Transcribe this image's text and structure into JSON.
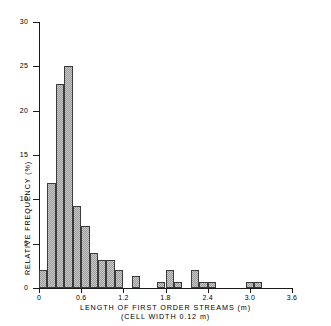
{
  "chart_data": {
    "type": "bar",
    "title": "",
    "xlabel": "LENGTH OF FIRST ORDER STREAMS (m)",
    "xsublabel": "(CELL WIDTH 0.12 m)",
    "ylabel": "RELATIVE FREQUENCY (%)",
    "xlim": [
      0,
      3.6
    ],
    "ylim": [
      0,
      30
    ],
    "grid": false,
    "legend": null,
    "bin_width": 0.12,
    "xticks": [
      0,
      0.6,
      1.2,
      1.8,
      2.4,
      3.0,
      3.6
    ],
    "xtick_labels": [
      "0",
      "0.6",
      "1.2",
      "1.8",
      "2.4",
      "3.0",
      "3.6"
    ],
    "yticks": [
      0,
      5,
      10,
      15,
      20,
      25,
      30
    ],
    "ytick_labels": [
      "0",
      "5",
      "10",
      "15",
      "20",
      "25",
      "30"
    ],
    "bars": [
      {
        "bin_start": 0.0,
        "bin_end": 0.12,
        "value": 2.0
      },
      {
        "bin_start": 0.12,
        "bin_end": 0.24,
        "value": 11.8
      },
      {
        "bin_start": 0.24,
        "bin_end": 0.36,
        "value": 23.0
      },
      {
        "bin_start": 0.36,
        "bin_end": 0.48,
        "value": 25.0
      },
      {
        "bin_start": 0.48,
        "bin_end": 0.6,
        "value": 9.2
      },
      {
        "bin_start": 0.6,
        "bin_end": 0.72,
        "value": 7.0
      },
      {
        "bin_start": 0.72,
        "bin_end": 0.84,
        "value": 4.0
      },
      {
        "bin_start": 0.84,
        "bin_end": 0.96,
        "value": 3.2
      },
      {
        "bin_start": 0.96,
        "bin_end": 1.08,
        "value": 3.2
      },
      {
        "bin_start": 1.08,
        "bin_end": 1.2,
        "value": 2.0
      },
      {
        "bin_start": 1.32,
        "bin_end": 1.44,
        "value": 1.3
      },
      {
        "bin_start": 1.68,
        "bin_end": 1.8,
        "value": 0.7
      },
      {
        "bin_start": 1.8,
        "bin_end": 1.92,
        "value": 2.0
      },
      {
        "bin_start": 1.92,
        "bin_end": 2.04,
        "value": 0.7
      },
      {
        "bin_start": 2.16,
        "bin_end": 2.28,
        "value": 2.0
      },
      {
        "bin_start": 2.28,
        "bin_end": 2.4,
        "value": 0.7
      },
      {
        "bin_start": 2.4,
        "bin_end": 2.52,
        "value": 0.7
      },
      {
        "bin_start": 2.94,
        "bin_end": 3.06,
        "value": 0.7
      },
      {
        "bin_start": 3.06,
        "bin_end": 3.18,
        "value": 0.7
      }
    ]
  }
}
